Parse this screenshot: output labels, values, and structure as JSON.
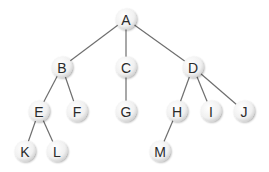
{
  "diagram": {
    "type": "tree",
    "colors": {
      "edge": "#6e6e6e",
      "node_fill_center": "#ffffff",
      "node_fill_edge": "#d6d6d6",
      "label": "#2a2a2a"
    },
    "nodes": [
      {
        "id": "A",
        "label": "A",
        "x": 126,
        "y": 19
      },
      {
        "id": "B",
        "label": "B",
        "x": 62,
        "y": 67
      },
      {
        "id": "C",
        "label": "C",
        "x": 126,
        "y": 67
      },
      {
        "id": "D",
        "label": "D",
        "x": 193,
        "y": 67
      },
      {
        "id": "E",
        "label": "E",
        "x": 39,
        "y": 111
      },
      {
        "id": "F",
        "label": "F",
        "x": 77,
        "y": 111
      },
      {
        "id": "G",
        "label": "G",
        "x": 126,
        "y": 111
      },
      {
        "id": "H",
        "label": "H",
        "x": 177,
        "y": 111
      },
      {
        "id": "I",
        "label": "I",
        "x": 211,
        "y": 111
      },
      {
        "id": "J",
        "label": "J",
        "x": 244,
        "y": 111
      },
      {
        "id": "K",
        "label": "K",
        "x": 25,
        "y": 151
      },
      {
        "id": "L",
        "label": "L",
        "x": 57,
        "y": 151
      },
      {
        "id": "M",
        "label": "M",
        "x": 160,
        "y": 151
      }
    ],
    "edges": [
      [
        "A",
        "B"
      ],
      [
        "A",
        "C"
      ],
      [
        "A",
        "D"
      ],
      [
        "B",
        "E"
      ],
      [
        "B",
        "F"
      ],
      [
        "C",
        "G"
      ],
      [
        "D",
        "H"
      ],
      [
        "D",
        "I"
      ],
      [
        "D",
        "J"
      ],
      [
        "E",
        "K"
      ],
      [
        "E",
        "L"
      ],
      [
        "H",
        "M"
      ]
    ]
  }
}
